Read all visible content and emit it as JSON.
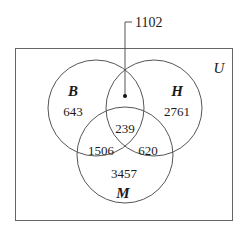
{
  "diagram": {
    "type": "venn-3-set",
    "universe_label": "U",
    "callout": {
      "label": "1102",
      "points_to": "B-and-H-only-region"
    },
    "sets": [
      {
        "key": "B",
        "label": "B",
        "count": "643"
      },
      {
        "key": "H",
        "label": "H",
        "count": "2761"
      },
      {
        "key": "M",
        "label": "M",
        "count": "3457"
      }
    ],
    "regions": [
      {
        "name": "B-only",
        "value": "643"
      },
      {
        "name": "H-only",
        "value": "2761"
      },
      {
        "name": "M-only",
        "value": "3457"
      },
      {
        "name": "B-and-H-only",
        "value": "1102"
      },
      {
        "name": "B-and-M-only",
        "value": "1506"
      },
      {
        "name": "H-and-M-only",
        "value": "620"
      },
      {
        "name": "B-and-H-and-M",
        "value": "239"
      }
    ],
    "colors": {
      "stroke": "#555555",
      "text": "#1a1a1a",
      "background": "#ffffff"
    }
  }
}
